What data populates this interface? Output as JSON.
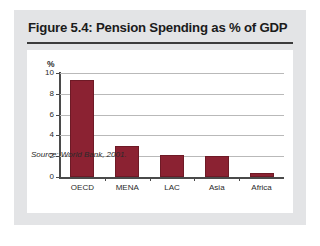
{
  "figure": {
    "title": "Figure 5.4: Pension Spending as % of GDP",
    "source": "Source: World Bank, 2001."
  },
  "colors": {
    "bar": "#8b2232",
    "panel": "#e3e4e6",
    "card": "#ffffff",
    "axis": "#4a4a4a",
    "gridline": "#b9b9b9"
  },
  "chart_data": {
    "type": "bar",
    "title": "Figure 5.4: Pension Spending as % of GDP",
    "categories": [
      "OECD",
      "MENA",
      "LAC",
      "Asia",
      "Africa"
    ],
    "values": [
      9.3,
      3.0,
      2.1,
      2.0,
      0.4
    ],
    "xlabel": "",
    "ylabel": "%",
    "ylim": [
      0,
      10
    ],
    "yticks": [
      0,
      2,
      4,
      6,
      8,
      10
    ],
    "ytick_labels": [
      "0",
      "2",
      "4",
      "6",
      "8",
      "10"
    ],
    "grid": true,
    "legend": false,
    "annotations": [
      "Source: World Bank, 2001."
    ]
  }
}
